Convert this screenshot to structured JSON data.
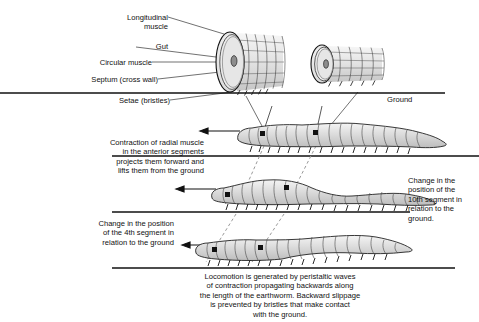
{
  "diagram": {
    "background_color": "#ffffff",
    "ink_color": "#111111",
    "body_fill": "#d8d8d8",
    "dash_color": "#9a9a9a"
  },
  "labels": {
    "longitudinal_muscle": "Longitudinal\nmuscle",
    "gut": "Gut",
    "circular_muscle": "Circular muscle",
    "septum": "Septum (cross wall)",
    "setae": "Setae (bristles)",
    "ground": "Ground"
  },
  "annotations": {
    "contraction_note": "Contraction of radial muscle\nin the anterior segments\nprojects them forward and\nlifts them from the ground",
    "segment10_note": "Change in the\nposition of the\n10th segment in\nrelation to the\nground.",
    "segment4_note": "Change in the position\nof the 4th segment in\nrelation to the ground",
    "caption": "Locomotion is generated by peristaltic waves\nof contraction propagating backwards along\nthe length of the earthworm. Backward slippage\nis prevented by bristles that make contact\nwith the ground."
  },
  "cylinders": [
    {
      "name": "contracted-segment",
      "state": "contracted",
      "description": "wide short cylinder with circular muscle rings and setae"
    },
    {
      "name": "extended-segment",
      "state": "extended",
      "description": "narrow long cylinder with circular muscle rings and setae"
    }
  ],
  "worms": [
    {
      "name": "worm-frame-1",
      "frame": 1,
      "segments": 16,
      "marked_segments": [
        4,
        10
      ],
      "direction": "left"
    },
    {
      "name": "worm-frame-2",
      "frame": 2,
      "segments": 16,
      "marked_segments": [
        4,
        10
      ],
      "direction": "left"
    },
    {
      "name": "worm-frame-3",
      "frame": 3,
      "segments": 16,
      "marked_segments": [
        4,
        10
      ],
      "direction": "left"
    }
  ],
  "arrows": {
    "direction_label": "direction of travel",
    "count": 3
  },
  "tracking_lines": {
    "segment_4": "dashed line tracking 4th segment across frames",
    "segment_10": "dashed line tracking 10th segment across frames"
  }
}
